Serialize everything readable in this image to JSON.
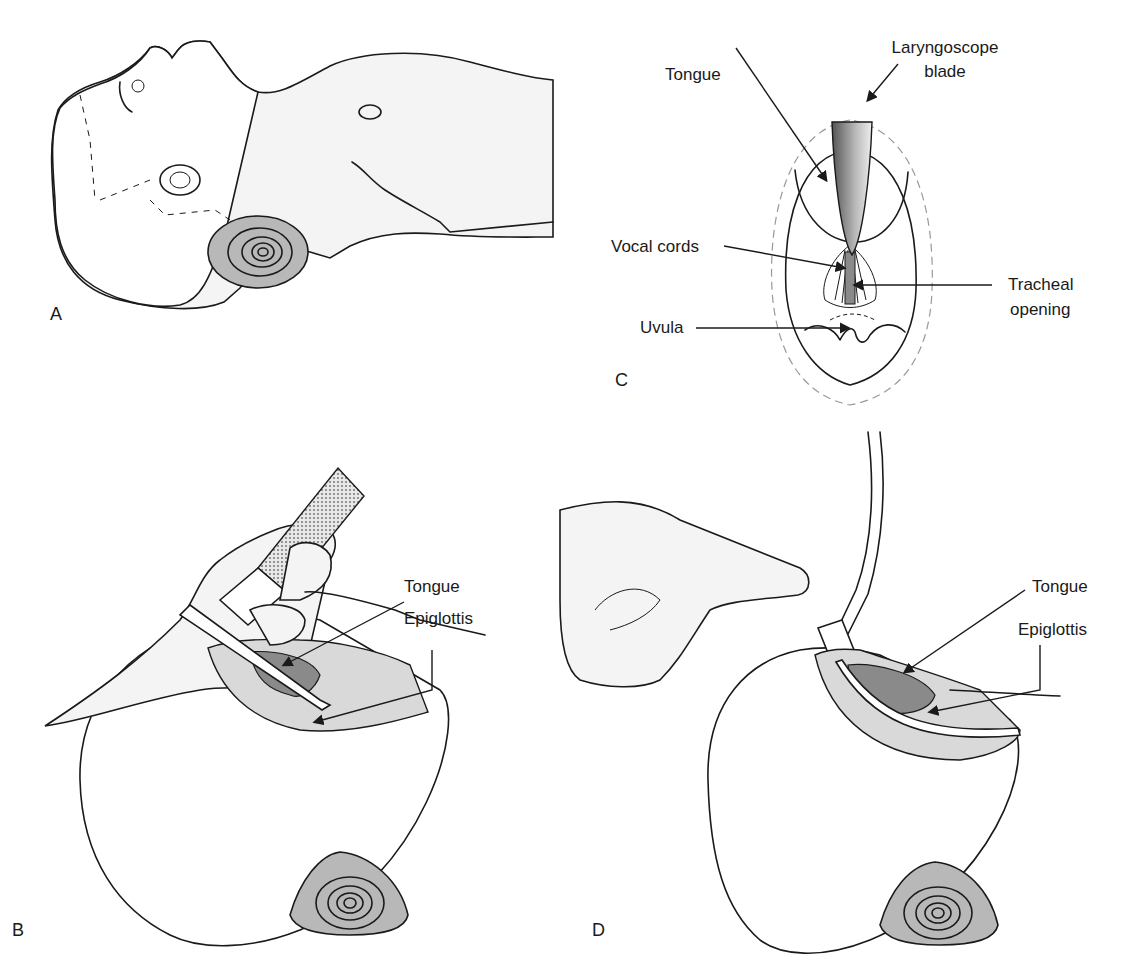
{
  "figure": {
    "panels": [
      {
        "id": "A",
        "letter": "A",
        "description": "Infant lying supine with rolled towel under shoulders (sniffing position)"
      },
      {
        "id": "B",
        "letter": "B",
        "description": "Laryngoscope inserted, hand holding handle; tongue displaced",
        "labels": {
          "tongue": "Tongue",
          "epiglottis": "Epiglottis"
        }
      },
      {
        "id": "C",
        "letter": "C",
        "description": "View of the larynx through the laryngoscope",
        "labels": {
          "tongue": "Tongue",
          "laryngoscope_blade_line1": "Laryngoscope",
          "laryngoscope_blade_line2": "blade",
          "vocal_cords": "Vocal cords",
          "tracheal_opening_line1": "Tracheal",
          "tracheal_opening_line2": "opening",
          "uvula": "Uvula"
        }
      },
      {
        "id": "D",
        "letter": "D",
        "description": "Endotracheal tube with suction catheter; finger occluding port",
        "labels": {
          "tongue": "Tongue",
          "epiglottis": "Epiglottis"
        }
      }
    ]
  },
  "colors": {
    "line": "#1a1a1a",
    "skin_shade": "#f4f4f4",
    "pillow": "#b8b8b8",
    "tissue": "#d9d9d9",
    "tongue": "#8a8a8a"
  }
}
